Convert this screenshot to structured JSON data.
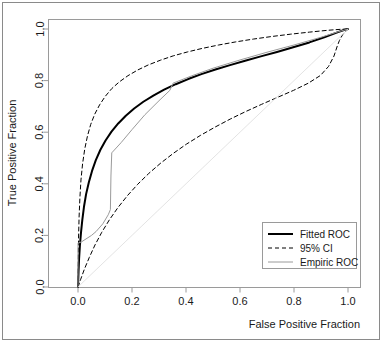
{
  "chart_data": {
    "type": "line",
    "title": "",
    "xlabel": "False Positive Fraction",
    "ylabel": "True Positive Fraction",
    "xlim": [
      0.0,
      1.0
    ],
    "ylim": [
      0.0,
      1.0
    ],
    "xticks": [
      "0.0",
      "0.2",
      "0.4",
      "0.6",
      "0.8",
      "1.0"
    ],
    "xtick_values": [
      0.0,
      0.2,
      0.4,
      0.6,
      0.8,
      1.0
    ],
    "yticks": [
      "0.0",
      "0.2",
      "0.4",
      "0.6",
      "0.8",
      "1.0"
    ],
    "ytick_values": [
      0.0,
      0.2,
      0.4,
      0.6,
      0.8,
      1.0
    ],
    "grid": false,
    "legend_position": "bottom-right",
    "series": [
      {
        "name": "Fitted ROC",
        "style": "solid",
        "color": "#000000",
        "width": 2.0,
        "points": [
          [
            0.0,
            0.0
          ],
          [
            0.002,
            0.06
          ],
          [
            0.004,
            0.11
          ],
          [
            0.007,
            0.16
          ],
          [
            0.011,
            0.21
          ],
          [
            0.016,
            0.26
          ],
          [
            0.022,
            0.31
          ],
          [
            0.03,
            0.36
          ],
          [
            0.04,
            0.405
          ],
          [
            0.052,
            0.45
          ],
          [
            0.066,
            0.492
          ],
          [
            0.083,
            0.532
          ],
          [
            0.102,
            0.568
          ],
          [
            0.124,
            0.602
          ],
          [
            0.149,
            0.634
          ],
          [
            0.177,
            0.664
          ],
          [
            0.208,
            0.692
          ],
          [
            0.242,
            0.718
          ],
          [
            0.279,
            0.742
          ],
          [
            0.319,
            0.765
          ],
          [
            0.362,
            0.786
          ],
          [
            0.408,
            0.806
          ],
          [
            0.457,
            0.825
          ],
          [
            0.509,
            0.843
          ],
          [
            0.563,
            0.86
          ],
          [
            0.619,
            0.877
          ],
          [
            0.677,
            0.894
          ],
          [
            0.737,
            0.911
          ],
          [
            0.797,
            0.929
          ],
          [
            0.857,
            0.948
          ],
          [
            0.912,
            0.968
          ],
          [
            0.958,
            0.986
          ],
          [
            0.985,
            0.996
          ],
          [
            1.0,
            1.0
          ]
        ]
      },
      {
        "name": "95% CI",
        "style": "dashed",
        "color": "#000000",
        "width": 1.0,
        "bounds": "upper",
        "points": [
          [
            0.0,
            0.0
          ],
          [
            0.001,
            0.1
          ],
          [
            0.002,
            0.19
          ],
          [
            0.004,
            0.27
          ],
          [
            0.007,
            0.345
          ],
          [
            0.011,
            0.415
          ],
          [
            0.017,
            0.478
          ],
          [
            0.025,
            0.535
          ],
          [
            0.035,
            0.585
          ],
          [
            0.047,
            0.63
          ],
          [
            0.062,
            0.67
          ],
          [
            0.08,
            0.706
          ],
          [
            0.101,
            0.739
          ],
          [
            0.125,
            0.769
          ],
          [
            0.153,
            0.795
          ],
          [
            0.185,
            0.819
          ],
          [
            0.221,
            0.841
          ],
          [
            0.261,
            0.861
          ],
          [
            0.305,
            0.879
          ],
          [
            0.353,
            0.896
          ],
          [
            0.405,
            0.911
          ],
          [
            0.461,
            0.925
          ],
          [
            0.521,
            0.938
          ],
          [
            0.584,
            0.95
          ],
          [
            0.65,
            0.961
          ],
          [
            0.718,
            0.971
          ],
          [
            0.788,
            0.98
          ],
          [
            0.858,
            0.988
          ],
          [
            0.925,
            0.995
          ],
          [
            0.975,
            0.999
          ],
          [
            1.0,
            1.0
          ]
        ]
      },
      {
        "name": "95% CI",
        "style": "dashed",
        "color": "#000000",
        "width": 1.0,
        "bounds": "lower",
        "points": [
          [
            0.0,
            0.0
          ],
          [
            0.01,
            0.03
          ],
          [
            0.024,
            0.07
          ],
          [
            0.042,
            0.115
          ],
          [
            0.063,
            0.163
          ],
          [
            0.088,
            0.212
          ],
          [
            0.116,
            0.26
          ],
          [
            0.148,
            0.308
          ],
          [
            0.183,
            0.354
          ],
          [
            0.221,
            0.398
          ],
          [
            0.262,
            0.44
          ],
          [
            0.306,
            0.48
          ],
          [
            0.353,
            0.518
          ],
          [
            0.402,
            0.554
          ],
          [
            0.454,
            0.588
          ],
          [
            0.508,
            0.62
          ],
          [
            0.564,
            0.651
          ],
          [
            0.621,
            0.68
          ],
          [
            0.68,
            0.708
          ],
          [
            0.739,
            0.735
          ],
          [
            0.798,
            0.762
          ],
          [
            0.853,
            0.79
          ],
          [
            0.898,
            0.82
          ],
          [
            0.928,
            0.855
          ],
          [
            0.948,
            0.895
          ],
          [
            0.96,
            0.933
          ],
          [
            0.968,
            0.955
          ],
          [
            0.98,
            0.978
          ],
          [
            1.0,
            1.0
          ]
        ]
      },
      {
        "name": "Empiric ROC",
        "style": "solid",
        "color": "#9a9a9a",
        "width": 1.0,
        "points": [
          [
            0.0,
            0.0
          ],
          [
            0.0,
            0.17
          ],
          [
            0.013,
            0.175
          ],
          [
            0.05,
            0.2
          ],
          [
            0.067,
            0.215
          ],
          [
            0.092,
            0.245
          ],
          [
            0.112,
            0.28
          ],
          [
            0.12,
            0.3
          ],
          [
            0.122,
            0.43
          ],
          [
            0.125,
            0.52
          ],
          [
            0.16,
            0.56
          ],
          [
            0.2,
            0.61
          ],
          [
            0.248,
            0.668
          ],
          [
            0.3,
            0.722
          ],
          [
            0.34,
            0.762
          ],
          [
            0.352,
            0.79
          ],
          [
            0.42,
            0.818
          ],
          [
            0.5,
            0.848
          ],
          [
            0.6,
            0.88
          ],
          [
            0.7,
            0.91
          ],
          [
            0.8,
            0.938
          ],
          [
            0.9,
            0.968
          ],
          [
            0.96,
            0.988
          ],
          [
            1.0,
            1.0
          ]
        ]
      },
      {
        "name": "chance-line",
        "style": "solid",
        "color": "#dcdcdc",
        "width": 0.8,
        "points": [
          [
            0.0,
            0.0
          ],
          [
            1.0,
            1.0
          ]
        ]
      }
    ],
    "legend": [
      {
        "label": "Fitted ROC",
        "style": "solid",
        "color": "#000000",
        "width": 2.0
      },
      {
        "label": "95% CI",
        "style": "dashed",
        "color": "#000000",
        "width": 1.0
      },
      {
        "label": "Empiric ROC",
        "style": "solid",
        "color": "#9a9a9a",
        "width": 1.0
      }
    ]
  },
  "axes": {
    "x_title": "False Positive Fraction",
    "y_title": "True Positive Fraction",
    "x_tick_labels": [
      "0.0",
      "0.2",
      "0.4",
      "0.6",
      "0.8",
      "1.0"
    ],
    "y_tick_labels": [
      "0.0",
      "0.2",
      "0.4",
      "0.6",
      "0.8",
      "1.0"
    ]
  },
  "legend": {
    "items": [
      {
        "label": "Fitted ROC"
      },
      {
        "label": "95% CI"
      },
      {
        "label": "Empiric ROC"
      }
    ]
  },
  "colors": {
    "fitted": "#000000",
    "ci": "#000000",
    "empiric": "#9a9a9a",
    "chance": "#dcdcdc",
    "axis": "#9a9a9a",
    "frame": "#8a8a8a",
    "text": "#1a1a1a"
  }
}
